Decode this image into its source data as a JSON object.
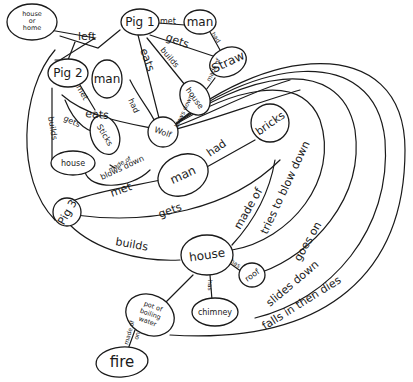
{
  "diagram": {
    "type": "hand-drawn concept map",
    "ink_color": "#1a1a1a",
    "background": "#ffffff"
  },
  "nodes": {
    "house_or_home": {
      "l1": "house",
      "l2": "or",
      "l3": "home"
    },
    "pig1": "Pig 1",
    "man_top": "man",
    "straw": "Straw",
    "house_top": "house",
    "pig2": "Pig 2",
    "man_mid": "man",
    "sticks": "Sticks",
    "wolf": "Wolf",
    "house_left": "house",
    "man_center": "man",
    "bricks": "bricks",
    "pig3": "Pig 3",
    "house_bottom": "house",
    "roof": "roof",
    "chimney": "chimney",
    "pot": {
      "l1": "pot of",
      "l2": "boiling",
      "l3": "water"
    },
    "fire": "fire"
  },
  "edges": {
    "left": "left",
    "pig1_met": "met",
    "pig1_gets": "gets",
    "pig1_builds": "builds",
    "wolf_eats_pig1": "eats",
    "man_had": "had",
    "straw_made_of": "made of",
    "pig2_met": "met",
    "pig2_gets": "gets",
    "pig2_builds": "builds",
    "wolf_eats_pig2": "eats",
    "man_had_sticks": "had",
    "sticks_made_of": "made of",
    "blows_down_top": "blows down",
    "blows_down_left": "blows down",
    "pig3_met": "met",
    "pig3_gets": "gets",
    "man_had_bricks": "had",
    "pig3_builds": "builds",
    "house_made_of": "made of",
    "tries_to_blow_down": "tries to blow down",
    "has_roof": "has",
    "has_chimney": "has",
    "goes_on": "goes on",
    "slides_down": "slides down",
    "falls_in_then_dies": "falls in then dies",
    "made_of_pot": "made of",
    "on": "on"
  }
}
